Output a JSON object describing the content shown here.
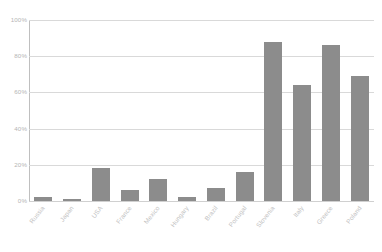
{
  "chart_data": {
    "type": "bar",
    "title": "",
    "subtitle": "",
    "xlabel": "",
    "ylabel": "",
    "ylim": [
      0,
      100
    ],
    "y_tick_labels": [
      "100%",
      "80%",
      "60%",
      "40%",
      "20%",
      "0%"
    ],
    "y_tick_values": [
      100,
      80,
      60,
      40,
      20,
      0
    ],
    "grid": "horizontal",
    "legend": "none",
    "bar_color": "#8c8c8c",
    "gridline_color": "#d9d9d9",
    "axis_color": "#bfbfbf",
    "label_color": "#c2c2c2",
    "categories": [
      "Russia",
      "Japan",
      "USA",
      "France",
      "Mexico",
      "Hungary",
      "Brazil",
      "Portugal",
      "Slovenia",
      "Italy",
      "Greece",
      "Poland"
    ],
    "values": [
      2,
      1,
      18,
      6,
      12,
      2,
      7,
      16,
      88,
      64,
      86,
      69
    ],
    "value_labels": [
      "2%",
      "1%",
      "18%",
      "6%",
      "12%",
      "2%",
      "7%",
      "16%",
      "88%",
      "64%",
      "86%",
      "69%"
    ]
  }
}
